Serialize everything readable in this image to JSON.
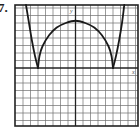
{
  "problem": {
    "number": "7."
  },
  "chart_data": {
    "type": "line",
    "title": "",
    "xlabel": "x",
    "ylabel": "y",
    "grid": true,
    "xlim": [
      -8,
      8.4
    ],
    "ylim": [
      -7.7,
      8.4
    ],
    "grid_step": 1,
    "tick_labels": false,
    "series": [
      {
        "name": "f(x)",
        "description": "Symmetric curve with cusps on the x-axis at x = -5 and x = 5, a smooth arch peaking near (0, 6.3) between them, and steep outer branches rising off the top of the grid.",
        "segments": [
          {
            "part": "left-outer-branch",
            "points": [
              [
                -6.6,
                8.4
              ],
              [
                -6.2,
                6.0
              ],
              [
                -5.8,
                3.6
              ],
              [
                -5.4,
                1.6
              ],
              [
                -5.0,
                0
              ]
            ]
          },
          {
            "part": "central-arch",
            "points": [
              [
                -5.0,
                0
              ],
              [
                -4.8,
                1.6
              ],
              [
                -4.4,
                2.9
              ],
              [
                -3.5,
                4.4
              ],
              [
                -2.5,
                5.4
              ],
              [
                -1.3,
                6.0
              ],
              [
                0,
                6.3
              ],
              [
                1.3,
                6.0
              ],
              [
                2.5,
                5.4
              ],
              [
                3.5,
                4.4
              ],
              [
                4.4,
                2.9
              ],
              [
                4.8,
                1.6
              ],
              [
                5.0,
                0
              ]
            ]
          },
          {
            "part": "right-outer-branch",
            "points": [
              [
                5.0,
                0
              ],
              [
                5.4,
                1.6
              ],
              [
                5.8,
                3.6
              ],
              [
                6.2,
                6.0
              ],
              [
                6.5,
                8.4
              ]
            ]
          }
        ],
        "key_points": {
          "cusps": [
            [
              -5,
              0
            ],
            [
              5,
              0
            ]
          ],
          "maximum": [
            0,
            6.3
          ]
        }
      }
    ]
  }
}
